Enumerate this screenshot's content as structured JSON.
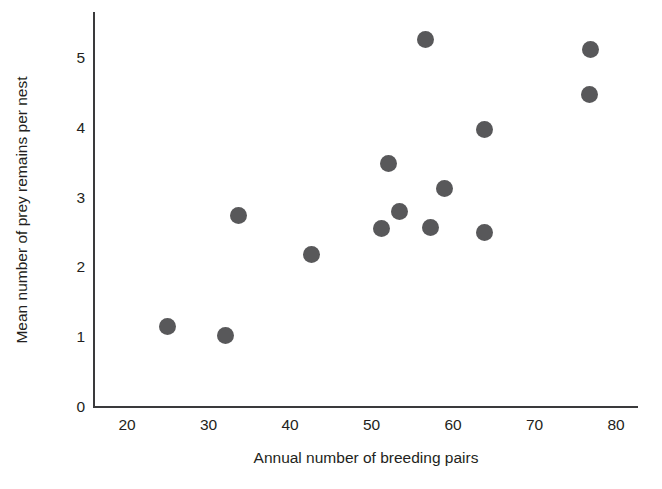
{
  "chart_data": {
    "type": "scatter",
    "title": "",
    "xlabel": "Annual number of breeding pairs",
    "ylabel": "Mean number of prey remains per nest",
    "xlim": [
      17,
      81.5
    ],
    "ylim": [
      0,
      5.65
    ],
    "xticks": [
      20,
      30,
      40,
      50,
      60,
      70,
      80
    ],
    "xtick_labels": [
      "20",
      "30",
      "40",
      "50",
      "60",
      "70",
      "80"
    ],
    "yticks": [
      0,
      1,
      2,
      3,
      4,
      5
    ],
    "ytick_labels": [
      "0",
      "1",
      "2",
      "3",
      "4",
      "5"
    ],
    "grid": false,
    "legend": null,
    "marker_color": "#58585a",
    "marker_size": 17,
    "axis_color": "#3a3a3c",
    "text_color": "#231f20",
    "background": "#ffffff",
    "points": [
      {
        "x": 25.0,
        "y": 1.15
      },
      {
        "x": 32.1,
        "y": 1.02
      },
      {
        "x": 33.7,
        "y": 2.75
      },
      {
        "x": 42.6,
        "y": 2.19
      },
      {
        "x": 51.2,
        "y": 2.56
      },
      {
        "x": 52.1,
        "y": 3.49
      },
      {
        "x": 53.4,
        "y": 2.8
      },
      {
        "x": 56.6,
        "y": 5.27
      },
      {
        "x": 57.3,
        "y": 2.57
      },
      {
        "x": 58.9,
        "y": 3.13
      },
      {
        "x": 63.9,
        "y": 3.97
      },
      {
        "x": 63.9,
        "y": 2.5
      },
      {
        "x": 76.8,
        "y": 4.48
      },
      {
        "x": 76.9,
        "y": 5.12
      }
    ]
  }
}
